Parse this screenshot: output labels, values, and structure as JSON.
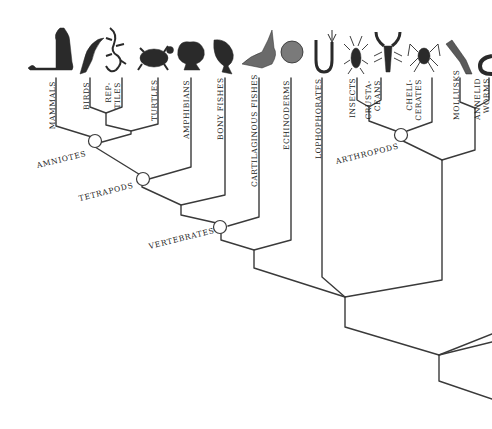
{
  "diagram": {
    "type": "phylogenetic-tree",
    "taxa": [
      {
        "label": "MAMMALS",
        "icon": "cheetah-icon"
      },
      {
        "label": "BIRDS",
        "icon": "bird-icon"
      },
      {
        "label_line1": "REP-",
        "label_line2": "TILES",
        "icon": "lizard-icon"
      },
      {
        "label": "TURTLES",
        "icon": "turtle-icon"
      },
      {
        "label": "AMPHIBIANS",
        "icon": "frog-icon"
      },
      {
        "label": "BONY FISHES",
        "icon": "fish-icon"
      },
      {
        "label": "CARTILAGINOUS FISHES",
        "icon": "shark-icon"
      },
      {
        "label": "ECHINODERMS",
        "icon": "sand-dollar-icon"
      },
      {
        "label": "LOPHOPHORATES",
        "icon": "lophophorate-icon"
      },
      {
        "label": "INSECTS",
        "icon": "insect-icon"
      },
      {
        "label_line1": "CRUSTA-",
        "label_line2": "CEANS",
        "icon": "lobster-icon"
      },
      {
        "label_line1": "CHELI-",
        "label_line2": "CERATES",
        "icon": "spider-icon"
      },
      {
        "label": "MOLLUSKS",
        "icon": "squid-icon"
      },
      {
        "label_line1": "ANNELID",
        "label_line2": "WORMS",
        "icon": "worm-icon"
      }
    ],
    "groups": {
      "amniotes": "AMNIOTES",
      "tetrapods": "TETRAPODS",
      "vertebrates": "VERTEBRATES",
      "arthropods": "ARTHROPODS"
    },
    "colors": {
      "line": "#3a3a3a",
      "text": "#222222",
      "icon": "#2a2a2a",
      "background": "#ffffff"
    }
  }
}
